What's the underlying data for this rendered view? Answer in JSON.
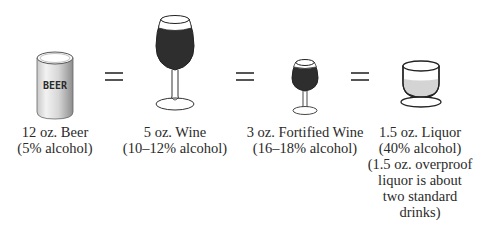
{
  "drinks": [
    {
      "icon": "beer-can-icon",
      "can_label": "BEER",
      "line1": "12 oz. Beer",
      "line2": "(5% alcohol)"
    },
    {
      "icon": "wine-glass-icon",
      "line1": "5 oz. Wine",
      "line2": "(10–12% alcohol)"
    },
    {
      "icon": "fortified-wine-glass-icon",
      "line1": "3 oz. Fortified Wine",
      "line2": "(16–18% alcohol)"
    },
    {
      "icon": "liquor-glass-icon",
      "line1": "1.5 oz. Liquor",
      "line2": "(40% alcohol)",
      "note_lines": [
        "(1.5 oz. overproof",
        "liquor is about",
        "two standard",
        "drinks)"
      ]
    }
  ],
  "separators": [
    "=",
    "=",
    "="
  ],
  "colors": {
    "wine": "#2e2e2e",
    "liquor": "#d4d4d4",
    "outline": "#333333",
    "can_light": "#f4f4f4",
    "can_dark": "#9a9a9a"
  }
}
